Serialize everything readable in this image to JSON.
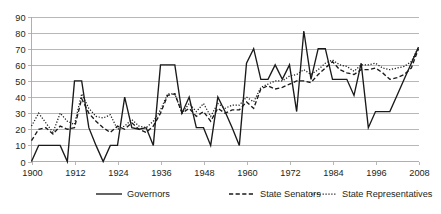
{
  "chart_data": {
    "type": "line",
    "title": "",
    "subtitle": "",
    "xlabel": "",
    "ylabel": "",
    "xlim": [
      1900,
      2008
    ],
    "ylim": [
      0,
      90
    ],
    "ytick_step": 10,
    "xtick_step": 12,
    "grid": "horizontal",
    "legend_position": "bottom",
    "yticks": [
      "0",
      "10",
      "20",
      "30",
      "40",
      "50",
      "60",
      "70",
      "80",
      "90"
    ],
    "xticks": [
      "1900",
      "1912",
      "1924",
      "1936",
      "1948",
      "1960",
      "1972",
      "1984",
      "1996",
      "2008"
    ],
    "x": [
      1900,
      1902,
      1904,
      1906,
      1908,
      1910,
      1912,
      1914,
      1916,
      1918,
      1920,
      1922,
      1924,
      1926,
      1928,
      1930,
      1932,
      1934,
      1936,
      1938,
      1940,
      1942,
      1944,
      1946,
      1948,
      1950,
      1952,
      1954,
      1956,
      1958,
      1960,
      1962,
      1964,
      1966,
      1968,
      1970,
      1972,
      1974,
      1976,
      1978,
      1980,
      1982,
      1984,
      1986,
      1988,
      1990,
      1992,
      1994,
      1996,
      1998,
      2000,
      2002,
      2004,
      2006,
      2008
    ],
    "series": [
      {
        "name": "Governors",
        "style": "solid",
        "color": "#1a1a1a",
        "values": [
          0,
          10,
          10,
          10,
          10,
          0,
          50,
          50,
          21,
          10,
          0,
          10,
          10,
          40,
          21,
          20,
          21,
          10,
          60,
          60,
          60,
          30,
          40,
          21,
          21,
          10,
          40,
          31,
          21,
          10,
          61,
          70,
          51,
          51,
          60,
          51,
          60,
          31,
          81,
          51,
          70,
          70,
          51,
          51,
          51,
          41,
          61,
          21,
          31,
          31,
          31,
          41,
          51,
          61,
          71
        ]
      },
      {
        "name": "State Senators",
        "style": "dashed",
        "color": "#1a1a1a",
        "values": [
          13,
          20,
          21,
          17,
          22,
          20,
          21,
          39,
          30,
          25,
          21,
          18,
          22,
          20,
          24,
          20,
          18,
          22,
          30,
          41,
          42,
          30,
          33,
          28,
          31,
          25,
          33,
          30,
          32,
          32,
          37,
          33,
          45,
          47,
          45,
          46,
          48,
          50,
          50,
          49,
          54,
          58,
          62,
          57,
          55,
          54,
          57,
          57,
          58,
          55,
          51,
          52,
          54,
          58,
          70
        ]
      },
      {
        "name": "State Representatives",
        "style": "dotted",
        "color": "#1a1a1a",
        "values": [
          22,
          30,
          24,
          18,
          30,
          25,
          23,
          42,
          33,
          28,
          27,
          29,
          20,
          22,
          26,
          22,
          21,
          25,
          32,
          42,
          42,
          30,
          36,
          31,
          36,
          28,
          36,
          33,
          35,
          35,
          40,
          37,
          46,
          48,
          50,
          50,
          53,
          54,
          57,
          54,
          57,
          61,
          63,
          60,
          59,
          56,
          60,
          60,
          61,
          58,
          57,
          58,
          59,
          62,
          71
        ]
      }
    ]
  },
  "legend": {
    "items": [
      {
        "label": "Governors",
        "style": "solid"
      },
      {
        "label": "State Senators",
        "style": "dashed"
      },
      {
        "label": "State Representatives",
        "style": "dotted"
      }
    ]
  }
}
